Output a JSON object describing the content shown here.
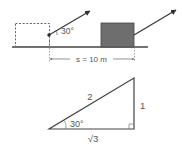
{
  "top_diagram": {
    "angle_label": "30°",
    "distance_label": "s = 10 m",
    "colors": {
      "line": "#444444",
      "block_fill": "#6e6e6e",
      "dashed": "#666666"
    }
  },
  "triangle": {
    "hypotenuse_label": "2",
    "opposite_label": "1",
    "adjacent_label": "√3",
    "angle_label": "30°",
    "colors": {
      "line": "#444444"
    }
  }
}
